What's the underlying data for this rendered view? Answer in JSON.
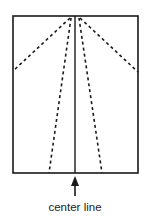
{
  "diagram": {
    "type": "fold-diagram",
    "label": "center line",
    "colors": {
      "stroke": "#1a1a1a",
      "background": "#ffffff"
    },
    "rectangle": {
      "x": 13,
      "y": 16,
      "width": 125,
      "height": 157
    },
    "center_line": {
      "x": 75,
      "y1": 16,
      "y2": 173
    },
    "dashed_lines": [
      {
        "name": "outer-left-fold",
        "x1": 70,
        "y1": 18,
        "x2": 13,
        "y2": 71
      },
      {
        "name": "inner-left-fold",
        "x1": 71,
        "y1": 18,
        "x2": 49,
        "y2": 173
      },
      {
        "name": "inner-right-fold",
        "x1": 79,
        "y1": 18,
        "x2": 102,
        "y2": 173
      },
      {
        "name": "outer-right-fold",
        "x1": 80,
        "y1": 18,
        "x2": 138,
        "y2": 72
      }
    ],
    "arrow": {
      "x": 75,
      "tip_y": 176,
      "tail_y": 196
    },
    "label_position": {
      "x": 75,
      "y": 211
    }
  }
}
